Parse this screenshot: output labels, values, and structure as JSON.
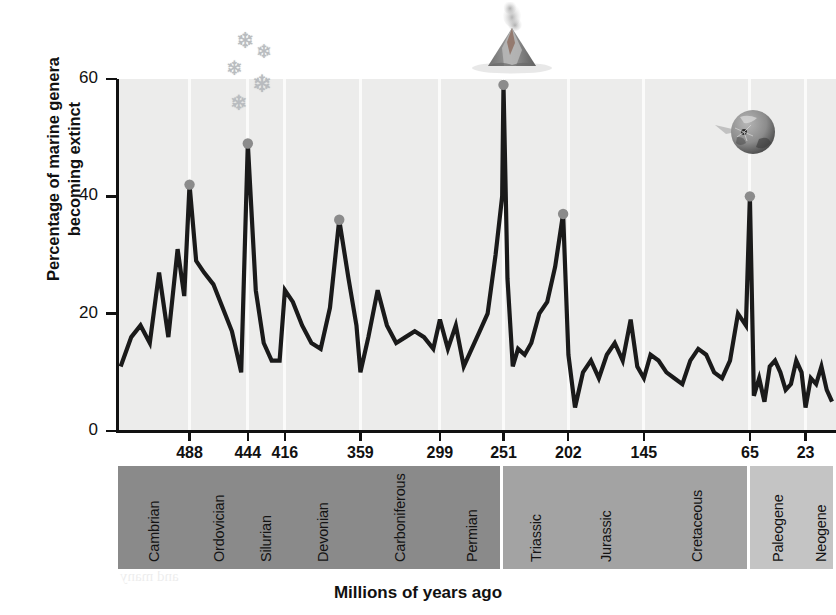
{
  "axes": {
    "y_title": "Percentage of marine genera becoming extinct",
    "x_title": "Millions of years ago",
    "y_ticks": [
      "0",
      "20",
      "40",
      "60"
    ],
    "x_ticks": [
      "488",
      "444",
      "416",
      "359",
      "299",
      "251",
      "202",
      "145",
      "65",
      "23"
    ]
  },
  "periods": [
    {
      "name": "Cambrian",
      "era": "Paleozoic"
    },
    {
      "name": "Ordovician",
      "era": "Paleozoic"
    },
    {
      "name": "Silurian",
      "era": "Paleozoic"
    },
    {
      "name": "Devonian",
      "era": "Paleozoic"
    },
    {
      "name": "Carboniferous",
      "era": "Paleozoic"
    },
    {
      "name": "Permian",
      "era": "Paleozoic"
    },
    {
      "name": "Triassic",
      "era": "Mesozoic"
    },
    {
      "name": "Jurassic",
      "era": "Mesozoic"
    },
    {
      "name": "Cretaceous",
      "era": "Mesozoic"
    },
    {
      "name": "Paleogene",
      "era": "Cenozoic"
    },
    {
      "name": "Neogene",
      "era": "Cenozoic"
    }
  ],
  "eras": [
    {
      "name": "Paleozoic",
      "color": "#8a8a8a"
    },
    {
      "name": "Mesozoic",
      "color": "#a3a3a3"
    },
    {
      "name": "Cenozoic",
      "color": "#c4c4c4"
    }
  ],
  "icons": [
    {
      "name": "snowflakes-icon",
      "event": "Ordovician glaciation"
    },
    {
      "name": "volcano-icon",
      "event": "Permian volcanism"
    },
    {
      "name": "asteroid-impact-icon",
      "event": "End-Cretaceous impact"
    }
  ],
  "colors": {
    "plot_background": "#ececeb",
    "curve": "#1a1a1a",
    "peak_marker": "#8b8b8b",
    "gridline": "#fbfbfa"
  },
  "showthrough": [
    {
      "text": "Millions of years ago",
      "x": 300,
      "y": 228,
      "size": 15
    },
    {
      "text": "FIGURE 2.5  The history of marine",
      "x": 118,
      "y": 246,
      "size": 17
    },
    {
      "text": "extinction rate of marine genera",
      "x": 120,
      "y": 268,
      "size": 16
    },
    {
      "text": "the record",
      "x": 120,
      "y": 290,
      "size": 16
    },
    {
      "text": "lived in the",
      "x": 592,
      "y": 238,
      "size": 16
    },
    {
      "text": "ous shell of  FIGURE",
      "x": 560,
      "y": 258,
      "size": 17
    },
    {
      "text": "shells are  a a Cret",
      "x": 566,
      "y": 280,
      "size": 16
    },
    {
      "text": "over a  provide",
      "x": 574,
      "y": 300,
      "size": 16
    },
    {
      "text": "extinction",
      "x": 120,
      "y": 470,
      "size": 15
    },
    {
      "text": "of the Cret",
      "x": 118,
      "y": 496,
      "size": 15
    },
    {
      "text": "65 milli",
      "x": 120,
      "y": 520,
      "size": 15
    },
    {
      "text": "wiped out",
      "x": 118,
      "y": 544,
      "size": 15
    },
    {
      "text": "and many",
      "x": 120,
      "y": 568,
      "size": 15
    }
  ],
  "chart_data": {
    "type": "line",
    "title": "",
    "xlabel": "Millions of years ago",
    "ylabel": "Percentage of marine genera becoming extinct",
    "xlim": [
      542,
      0
    ],
    "ylim": [
      0,
      60
    ],
    "x_reversed": true,
    "grid": "vertical-at-period-boundaries",
    "legend": "none",
    "y_ticks": [
      0,
      20,
      40,
      60
    ],
    "x_ticks": [
      488,
      444,
      416,
      359,
      299,
      251,
      202,
      145,
      65,
      23
    ],
    "period_boundaries": [
      542,
      488,
      444,
      416,
      359,
      299,
      251,
      202,
      145,
      65,
      23,
      0
    ],
    "era_boundaries": [
      {
        "era": "Paleozoic",
        "from": 542,
        "to": 251
      },
      {
        "era": "Mesozoic",
        "from": 251,
        "to": 65
      },
      {
        "era": "Cenozoic",
        "from": 65,
        "to": 0
      }
    ],
    "series": [
      {
        "name": "Percentage of marine genera becoming extinct",
        "x": [
          540,
          532,
          525,
          518,
          511,
          504,
          497,
          492,
          488,
          483,
          477,
          470,
          463,
          456,
          449,
          444,
          438,
          432,
          426,
          420,
          416,
          410,
          403,
          396,
          389,
          382,
          375,
          368,
          362,
          359,
          353,
          346,
          339,
          332,
          325,
          318,
          311,
          304,
          299,
          293,
          287,
          281,
          275,
          269,
          263,
          257,
          252,
          251,
          248,
          244,
          240,
          235,
          230,
          224,
          218,
          212,
          206,
          202,
          197,
          191,
          185,
          179,
          173,
          167,
          161,
          155,
          150,
          145,
          140,
          134,
          128,
          122,
          116,
          110,
          104,
          98,
          92,
          86,
          80,
          74,
          68,
          65,
          62,
          58,
          54,
          50,
          46,
          42,
          38,
          34,
          30,
          26,
          23,
          19,
          15,
          11,
          7,
          3
        ],
        "y": [
          11,
          16,
          18,
          15,
          27,
          16,
          31,
          23,
          42,
          29,
          27,
          25,
          21,
          17,
          10,
          49,
          24,
          15,
          12,
          12,
          24,
          22,
          18,
          15,
          14,
          21,
          36,
          26,
          18,
          10,
          16,
          24,
          18,
          15,
          16,
          17,
          16,
          14,
          19,
          14,
          18,
          11,
          14,
          17,
          20,
          30,
          40,
          59,
          26,
          11,
          14,
          13,
          15,
          20,
          22,
          28,
          37,
          13,
          4,
          10,
          12,
          9,
          13,
          15,
          12,
          19,
          11,
          9,
          13,
          12,
          10,
          9,
          8,
          12,
          14,
          13,
          10,
          9,
          12,
          20,
          18,
          40,
          6,
          9,
          5,
          11,
          12,
          10,
          7,
          8,
          12,
          10,
          4,
          9,
          8,
          11,
          7,
          5
        ]
      }
    ],
    "annotations": [
      {
        "label": "End-Cambrian",
        "x": 488,
        "y": 42,
        "marker": "dot"
      },
      {
        "label": "End-Ordovician",
        "x": 444,
        "y": 49,
        "marker": "dot",
        "icon": "snowflakes-icon"
      },
      {
        "label": "Late Devonian",
        "x": 375,
        "y": 36,
        "marker": "dot"
      },
      {
        "label": "End-Permian",
        "x": 251,
        "y": 59,
        "marker": "dot",
        "icon": "volcano-icon"
      },
      {
        "label": "End-Triassic",
        "x": 206,
        "y": 37,
        "marker": "dot"
      },
      {
        "label": "End-Cretaceous",
        "x": 65,
        "y": 40,
        "marker": "dot",
        "icon": "asteroid-impact-icon"
      }
    ]
  }
}
